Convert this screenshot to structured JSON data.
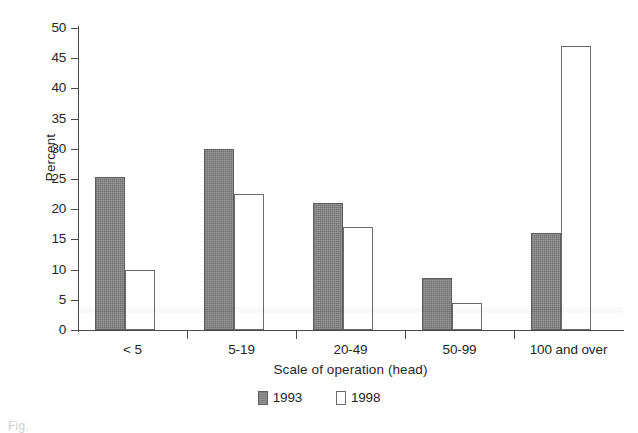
{
  "chart_data": {
    "type": "bar",
    "title": "",
    "xlabel": "Scale of operation (head)",
    "ylabel": "Percent",
    "ylim": [
      0,
      50
    ],
    "ytick_step": 5,
    "yticks": [
      "50",
      "45",
      "40",
      "35",
      "30",
      "25",
      "20",
      "15",
      "10",
      "5",
      "0"
    ],
    "grid": false,
    "legend_position": "bottom-center",
    "categories": [
      "< 5",
      "5-19",
      "20-49",
      "50-99",
      "100 and over"
    ],
    "series": [
      {
        "name": "1993",
        "color": "#7d7d7d",
        "values": [
          25.3,
          30.0,
          21.0,
          8.6,
          16.1
        ]
      },
      {
        "name": "1998",
        "color": "#ffffff",
        "values": [
          10.0,
          22.5,
          17.0,
          4.5,
          47.0
        ]
      }
    ]
  },
  "legend": {
    "items": [
      {
        "label": "1993"
      },
      {
        "label": "1998"
      }
    ]
  },
  "caption": {
    "fragment": "Fig."
  }
}
